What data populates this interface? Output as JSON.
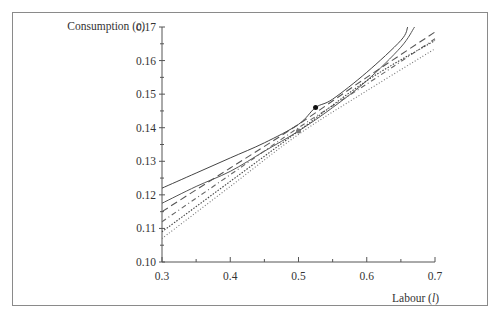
{
  "chart_data": {
    "type": "line",
    "title": "",
    "xlabel": "Labour (l)",
    "ylabel": "Consumption (c)",
    "xlabel_parts": {
      "text": "Labour ",
      "var": "l"
    },
    "ylabel_parts": {
      "text": "Consumption ",
      "var": "c"
    },
    "xlim": [
      0.3,
      0.7
    ],
    "ylim": [
      0.1,
      0.17
    ],
    "x_ticks": [
      "0.3",
      "0.4",
      "0.5",
      "0.6",
      "0.7"
    ],
    "y_ticks": [
      "0.10",
      "0.11",
      "0.12",
      "0.13",
      "0.14",
      "0.15",
      "0.16",
      "0.17"
    ],
    "grid": false,
    "legend": "none",
    "series": [
      {
        "name": "solid-curve-1",
        "style": "solid",
        "color": "#444444",
        "x": [
          0.3,
          0.35,
          0.4,
          0.45,
          0.5,
          0.525,
          0.55,
          0.6,
          0.65,
          0.66
        ],
        "y": [
          0.122,
          0.1265,
          0.131,
          0.1355,
          0.141,
          0.146,
          0.1485,
          0.1565,
          0.166,
          0.17
        ]
      },
      {
        "name": "solid-curve-2",
        "style": "solid",
        "color": "#555555",
        "x": [
          0.3,
          0.35,
          0.4,
          0.45,
          0.5,
          0.55,
          0.6,
          0.65,
          0.67
        ],
        "y": [
          0.1175,
          0.1225,
          0.127,
          0.133,
          0.139,
          0.146,
          0.154,
          0.164,
          0.17
        ]
      },
      {
        "name": "dashed-curve",
        "style": "dashed",
        "color": "#555555",
        "x": [
          0.3,
          0.4,
          0.5,
          0.6,
          0.7
        ],
        "y": [
          0.115,
          0.128,
          0.141,
          0.155,
          0.1685
        ]
      },
      {
        "name": "dash-dot-curve",
        "style": "dashdot",
        "color": "#666666",
        "x": [
          0.3,
          0.4,
          0.5,
          0.6,
          0.7
        ],
        "y": [
          0.112,
          0.126,
          0.14,
          0.153,
          0.1665
        ]
      },
      {
        "name": "dotted-curve",
        "style": "dotted",
        "color": "#444444",
        "x": [
          0.3,
          0.4,
          0.5,
          0.6,
          0.7
        ],
        "y": [
          0.109,
          0.124,
          0.139,
          0.154,
          0.166
        ]
      },
      {
        "name": "fine-dotted-curve",
        "style": "fine-dotted",
        "color": "#777777",
        "x": [
          0.3,
          0.4,
          0.5,
          0.6,
          0.7
        ],
        "y": [
          0.107,
          0.1225,
          0.138,
          0.151,
          0.1635
        ]
      }
    ],
    "points": [
      {
        "name": "black-point",
        "x": 0.525,
        "y": 0.146,
        "color": "#111111"
      },
      {
        "name": "grey-point",
        "x": 0.5,
        "y": 0.139,
        "color": "#777777"
      }
    ]
  }
}
